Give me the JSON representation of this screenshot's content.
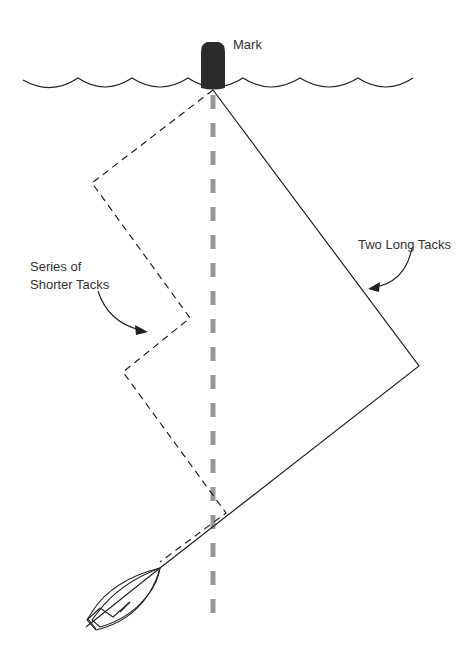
{
  "diagram": {
    "labels": {
      "mark": "Mark",
      "long_tacks": "Two Long Tacks",
      "short_tacks_line1": "Series of",
      "short_tacks_line2": "Shorter Tacks"
    },
    "colors": {
      "line": "#222222",
      "buoy": "#2b2b2b",
      "wind_axis": "#999999",
      "text": "#333333"
    },
    "elements": {
      "mark_buoy": {
        "x": 213,
        "y": 62
      },
      "water_waves": {
        "x_start": 23,
        "x_end": 413,
        "y": 80
      },
      "wind_axis_line": {
        "x": 213,
        "y_start": 95,
        "y_end": 622,
        "style": "dashed-gray"
      },
      "long_tacks_path": [
        [
          213,
          90
        ],
        [
          419,
          366
        ],
        [
          160,
          543
        ]
      ],
      "short_tacks_path": [
        [
          213,
          90
        ],
        [
          92,
          183
        ],
        [
          190,
          318
        ],
        [
          123,
          372
        ],
        [
          226,
          513
        ],
        [
          160,
          543
        ]
      ],
      "boat": {
        "bow": [
          160,
          568
        ],
        "stern": [
          86,
          626
        ]
      }
    }
  }
}
